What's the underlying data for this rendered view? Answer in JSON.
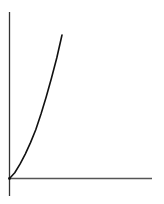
{
  "chart_data": {
    "type": "line",
    "title": "",
    "xlabel": "",
    "ylabel": "",
    "xlim": [
      0,
      1
    ],
    "ylim": [
      0,
      1
    ],
    "grid": false,
    "legend": null,
    "tick_labels": {
      "x": [],
      "y": []
    },
    "series": [
      {
        "name": "curve",
        "x": [
          0,
          0.1,
          0.2,
          0.3,
          0.4,
          0.5,
          0.6,
          0.7,
          0.8,
          0.9,
          1.0
        ],
        "values": [
          0,
          0.04,
          0.1,
          0.17,
          0.25,
          0.34,
          0.45,
          0.57,
          0.7,
          0.84,
          1.0
        ],
        "color": "#111111"
      }
    ],
    "axis_color": "#333333"
  }
}
